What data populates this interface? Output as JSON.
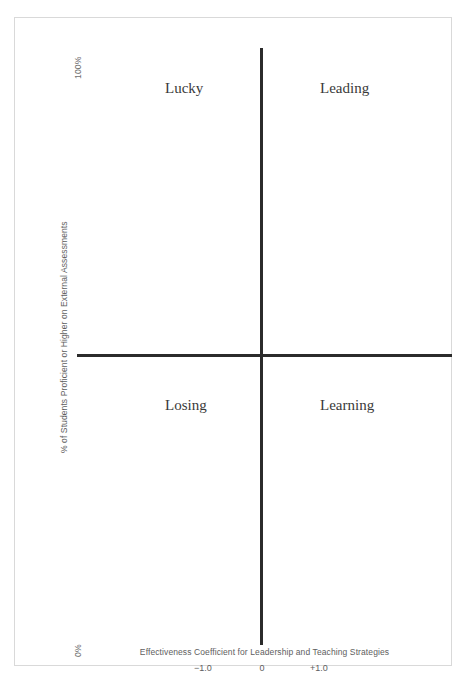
{
  "chart_data": {
    "type": "scatter",
    "title": "",
    "subtitle": "",
    "xlabel": "Effectiveness Coefficient for Leadership and Teaching Strategies",
    "ylabel": "% of Students Proficient or Higher on External Assessments",
    "xticks": [
      "−1.0",
      "0",
      "+1.0"
    ],
    "xtick_values": [
      -1.0,
      0,
      1.0
    ],
    "yticks": [
      "0%",
      "100%"
    ],
    "ytick_values": [
      0,
      100
    ],
    "xlim": [
      -2.0,
      2.0
    ],
    "ylim": [
      0,
      100
    ],
    "grid": false,
    "legend": null,
    "series": [],
    "values": [],
    "annotations": [
      {
        "label": "Lucky",
        "quadrant": "upper-left"
      },
      {
        "label": "Leading",
        "quadrant": "upper-right"
      },
      {
        "label": "Losing",
        "quadrant": "lower-left"
      },
      {
        "label": "Learning",
        "quadrant": "lower-right"
      }
    ],
    "axis_color": "#2b2b2b",
    "border_color": "#d9d9d9",
    "text_color": "#5e5e5e",
    "label_color": "#3a3a3a",
    "background": "#ffffff"
  },
  "quadrants": {
    "upper_left": "Lucky",
    "upper_right": "Leading",
    "lower_left": "Losing",
    "lower_right": "Learning"
  },
  "axes": {
    "y_title": "% of Students Proficient or Higher on External Assessments",
    "y_max_label": "100%",
    "y_min_label": "0%",
    "x_title": "Effectiveness Coefficient for Leadership and Teaching Strategies",
    "x_tick_negative": "−1.0",
    "x_tick_zero": "0",
    "x_tick_positive": "+1.0"
  }
}
